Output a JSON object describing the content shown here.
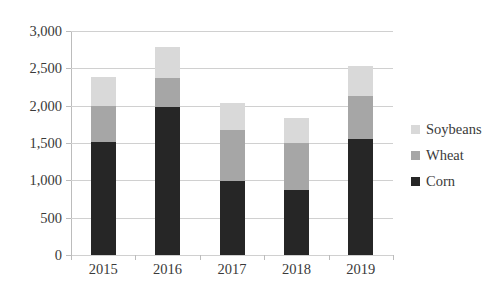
{
  "chart_data": {
    "type": "bar",
    "stacked": true,
    "title": "",
    "subtitle": "",
    "xlabel": "",
    "ylabel": "",
    "categories": [
      "2015",
      "2016",
      "2017",
      "2018",
      "2019"
    ],
    "series": [
      {
        "name": "Corn",
        "color": "#262626",
        "values": [
          1510,
          1980,
          990,
          870,
          1550
        ]
      },
      {
        "name": "Wheat",
        "color": "#a6a6a6",
        "values": [
          490,
          390,
          680,
          630,
          575
        ]
      },
      {
        "name": "Soybeans",
        "color": "#d9d9d9",
        "values": [
          380,
          410,
          365,
          335,
          405
        ]
      }
    ],
    "stack_totals": [
      2380,
      2780,
      2035,
      1835,
      2530
    ],
    "cumulative_tops": {
      "corn": [
        1510,
        1980,
        990,
        870,
        1550
      ],
      "wheat": [
        2000,
        2370,
        1670,
        1500,
        2125
      ],
      "soybeans": [
        2380,
        2780,
        2035,
        1835,
        2530
      ]
    },
    "ylim": [
      0,
      3000
    ],
    "y_ticks": [
      0,
      500,
      1000,
      1500,
      2000,
      2500,
      3000
    ],
    "y_tick_labels": [
      "0",
      "500",
      "1,000",
      "1,500",
      "2,000",
      "2,500",
      "3,000"
    ],
    "grid": true,
    "grid_axis": "y",
    "legend_position": "right",
    "legend_order": [
      "Soybeans",
      "Wheat",
      "Corn"
    ],
    "legend": [
      {
        "label": "Soybeans",
        "color": "#d9d9d9"
      },
      {
        "label": "Wheat",
        "color": "#a6a6a6"
      },
      {
        "label": "Corn",
        "color": "#262626"
      }
    ],
    "axis_color": "#bcbcbc",
    "grid_color": "#d0d0d0",
    "text_color": "#3a3a3a",
    "background": "#ffffff"
  }
}
